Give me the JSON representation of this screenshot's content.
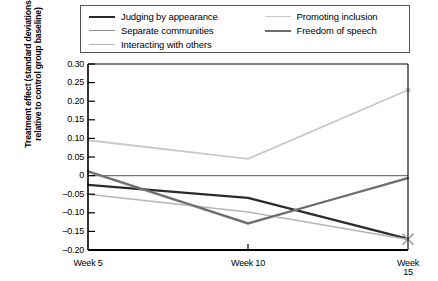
{
  "legend": {
    "columns": [
      {
        "items": [
          {
            "label": "Judging by appearance",
            "color": "#2b2b2b",
            "width": 2.2
          },
          {
            "label": "Separate communities",
            "color": "#8c8c8c",
            "width": 1.6
          },
          {
            "label": "Interacting with others",
            "color": "#b5b5b5",
            "width": 1.6
          }
        ]
      },
      {
        "items": [
          {
            "label": "Promoting inclusion",
            "color": "#c9c9c9",
            "width": 1.8
          },
          {
            "label": "Freedom of speech",
            "color": "#6e6e6e",
            "width": 2.0
          }
        ]
      }
    ]
  },
  "axes": {
    "ylabel_line1": "Treatment effect (standard deviations",
    "ylabel_line2": "relative to control group baseline)",
    "ytick_labels": [
      "0.30",
      "0.25",
      "0.20",
      "0.15",
      "0.10",
      "0.05",
      "0",
      "–0.05",
      "–0.10",
      "–0.15",
      "–0.20"
    ],
    "xtick_labels": [
      "Week 5",
      "Week 10",
      "Week 15"
    ]
  },
  "chart_data": {
    "type": "line",
    "title": "",
    "xlabel": "",
    "ylabel": "Treatment effect (standard deviations relative to control group baseline)",
    "categories": [
      "Week 5",
      "Week 10",
      "Week 15"
    ],
    "x": [
      5,
      10,
      15
    ],
    "ylim": [
      -0.2,
      0.3
    ],
    "yticks": [
      0.3,
      0.25,
      0.2,
      0.15,
      0.1,
      0.05,
      0,
      -0.05,
      -0.1,
      -0.15,
      -0.2
    ],
    "grid": false,
    "legend_position": "top",
    "zero_line": true,
    "series": [
      {
        "name": "Judging by appearance",
        "color": "#2b2b2b",
        "width": 2.2,
        "values": [
          -0.025,
          -0.06,
          -0.17
        ]
      },
      {
        "name": "Separate communities",
        "color": "#8c8c8c",
        "width": 1.6,
        "values": [
          0.01,
          -0.13,
          -0.005
        ]
      },
      {
        "name": "Interacting with others",
        "color": "#b5b5b5",
        "width": 1.6,
        "values": [
          -0.05,
          -0.098,
          -0.172
        ]
      },
      {
        "name": "Promoting inclusion",
        "color": "#c9c9c9",
        "width": 1.8,
        "values": [
          0.095,
          0.045,
          0.23
        ]
      },
      {
        "name": "Freedom of speech",
        "color": "#6e6e6e",
        "width": 2.0,
        "values": [
          0.012,
          -0.128,
          -0.007
        ]
      }
    ],
    "annotations": [
      {
        "kind": "marker",
        "shape": "x",
        "x": 15,
        "y": -0.171,
        "color": "#9a9a9a"
      },
      {
        "kind": "marker",
        "shape": "dot",
        "x": 15,
        "y": 0.23,
        "color": "#c9c9c9"
      }
    ]
  }
}
